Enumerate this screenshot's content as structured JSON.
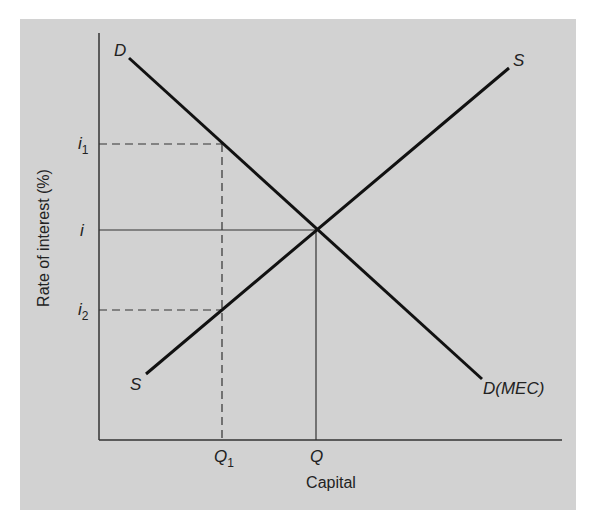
{
  "diagram": {
    "background_color": "#d2d2d2",
    "line_color": "#111111",
    "axes": {
      "x_label": "Capital",
      "y_label": "Rate of interest (%)"
    },
    "curves": {
      "demand": {
        "label_top": "D",
        "label_bottom": "D(MEC)"
      },
      "supply": {
        "label_top": "S",
        "label_bottom": "S"
      }
    },
    "y_ticks": [
      {
        "label": "i",
        "sub": "1"
      },
      {
        "label": "i",
        "sub": ""
      },
      {
        "label": "i",
        "sub": "2"
      }
    ],
    "x_ticks": [
      {
        "label": "Q",
        "sub": "1"
      },
      {
        "label": "Q",
        "sub": ""
      }
    ]
  }
}
